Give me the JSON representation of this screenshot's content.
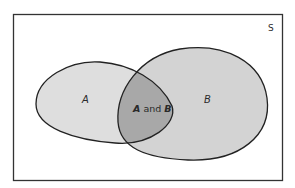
{
  "diagram": {
    "type": "venn",
    "universe": {
      "label": "S",
      "frame_color": "#333333",
      "fill": "#ffffff"
    },
    "sets": [
      {
        "id": "A",
        "label": "A",
        "fill": "#dcdcdc"
      },
      {
        "id": "B",
        "label": "B",
        "fill": "#d2d2d2"
      }
    ],
    "intersection": {
      "label_a": "A",
      "label_mid": " and ",
      "label_b": "B",
      "fill": "#a9a9a9"
    },
    "outline_color": "#222222"
  }
}
